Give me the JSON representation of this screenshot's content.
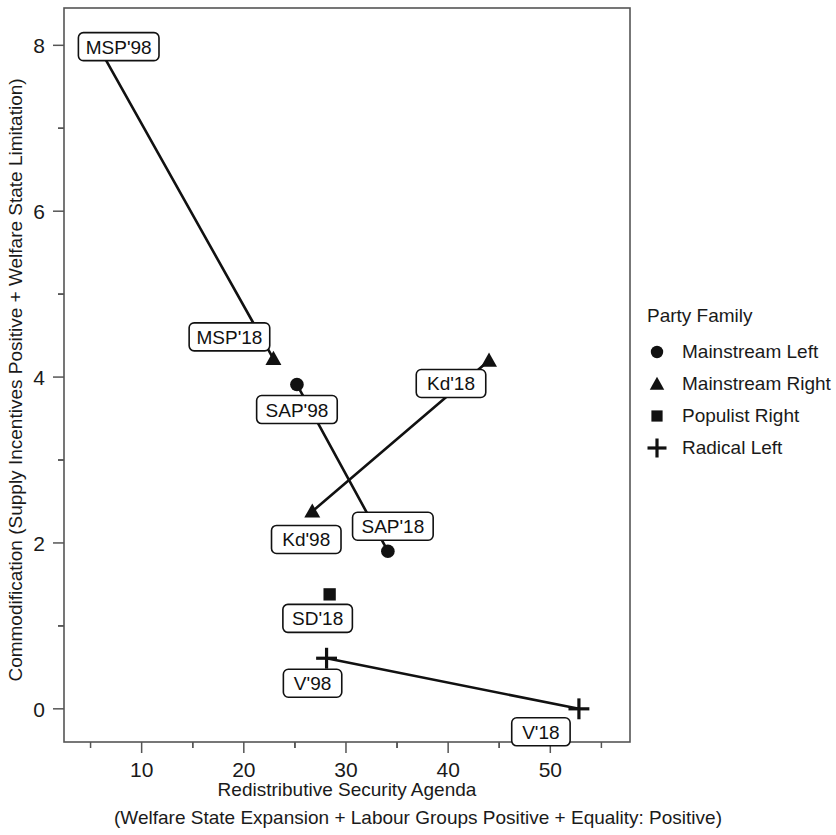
{
  "chart_data": {
    "type": "scatter",
    "title": "",
    "xlabel": "Redistributive Security Agenda",
    "xlabel_sub": "(Welfare State Expansion + Labour Groups Positive + Equality: Positive)",
    "ylabel": "Commodification (Supply Incentives Positive + Welfare State Limitation)",
    "xlim": [
      2.4,
      57.8
    ],
    "ylim": [
      -0.4,
      8.45
    ],
    "xticks": [
      10,
      20,
      30,
      40,
      50
    ],
    "xtick_labels": [
      "10",
      "20",
      "30",
      "40",
      "50"
    ],
    "yticks": [
      0,
      2,
      4,
      6,
      8
    ],
    "ytick_labels": [
      "0",
      "2",
      "4",
      "6",
      "8"
    ],
    "grid": false,
    "legend_position": "right",
    "points": [
      {
        "label": "MSP'98",
        "x": 5.6,
        "y": 8.02,
        "marker": "triangle",
        "family": "Mainstream Right",
        "label_dx": 22,
        "label_dy": 3
      },
      {
        "label": "MSP'18",
        "x": 22.9,
        "y": 4.22,
        "marker": "triangle",
        "family": "Mainstream Right",
        "label_dx": -44,
        "label_dy": -22
      },
      {
        "label": "SAP'98",
        "x": 25.2,
        "y": 3.91,
        "marker": "circle",
        "family": "Mainstream Left",
        "label_dx": 0,
        "label_dy": 25
      },
      {
        "label": "Kd'18",
        "x": 44.0,
        "y": 4.2,
        "marker": "triangle",
        "family": "Mainstream Right",
        "label_dx": -38,
        "label_dy": 23
      },
      {
        "label": "Kd'98",
        "x": 26.7,
        "y": 2.38,
        "marker": "triangle",
        "family": "Mainstream Right",
        "label_dx": -6,
        "label_dy": 28
      },
      {
        "label": "SAP'18",
        "x": 34.1,
        "y": 1.9,
        "marker": "circle",
        "family": "Mainstream Left",
        "label_dx": 5,
        "label_dy": -25
      },
      {
        "label": "SD'18",
        "x": 28.4,
        "y": 1.38,
        "marker": "square",
        "family": "Populist Right",
        "label_dx": -12,
        "label_dy": 24
      },
      {
        "label": "V'98",
        "x": 28.1,
        "y": 0.61,
        "marker": "plus",
        "family": "Radical Left",
        "label_dx": -14,
        "label_dy": 25
      },
      {
        "label": "V'18",
        "x": 52.8,
        "y": 0.0,
        "marker": "plus",
        "family": "Radical Left",
        "label_dx": -38,
        "label_dy": 23
      }
    ],
    "connections": [
      {
        "name": "MSP",
        "from": "MSP'98",
        "to": "MSP'18"
      },
      {
        "name": "SAP",
        "from": "SAP'98",
        "to": "SAP'18"
      },
      {
        "name": "Kd",
        "from": "Kd'98",
        "to": "Kd'18"
      },
      {
        "name": "V",
        "from": "V'98",
        "to": "V'18"
      }
    ],
    "legend": {
      "title": "Party Family",
      "entries": [
        {
          "label": "Mainstream Left",
          "marker": "circle"
        },
        {
          "label": "Mainstream Right",
          "marker": "triangle"
        },
        {
          "label": "Populist Right",
          "marker": "square"
        },
        {
          "label": "Radical Left",
          "marker": "plus"
        }
      ]
    },
    "colors": {
      "marker": "#111111",
      "line": "#111111",
      "frame": "#555555",
      "text": "#1a1a1a",
      "background": "#ffffff"
    }
  }
}
